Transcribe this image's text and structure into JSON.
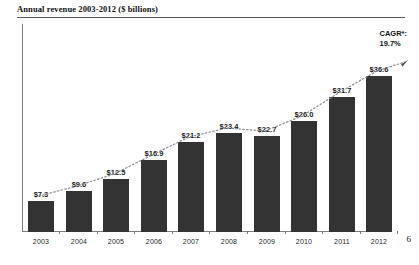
{
  "slide": {
    "title": "Annual revenue 2003-2012 ($ billions)",
    "page_number": "6"
  },
  "annotation": {
    "cagr_label": "CAGR*:",
    "cagr_value": "19.7%"
  },
  "chart_data": {
    "type": "bar",
    "title": "Annual revenue 2003-2012 ($ billions)",
    "xlabel": "",
    "ylabel": "",
    "ylim": [
      0,
      40
    ],
    "grid": false,
    "legend": null,
    "categories": [
      "2003",
      "2004",
      "2005",
      "2006",
      "2007",
      "2008",
      "2009",
      "2010",
      "2011",
      "2012"
    ],
    "values": [
      7.3,
      9.6,
      12.5,
      16.9,
      21.2,
      23.4,
      22.7,
      26.0,
      31.7,
      36.6
    ],
    "value_labels": [
      "$7.3",
      "$9.6",
      "$12.5",
      "$16.9",
      "$21.2",
      "$23.4",
      "$22.7",
      "$26.0",
      "$31.7",
      "$36.6"
    ],
    "bar_color": "#333333",
    "annotations": [
      {
        "text": "CAGR*:",
        "position": "top-right"
      },
      {
        "text": "19.7%",
        "position": "top-right"
      }
    ],
    "trendline": {
      "style": "dotted",
      "arrow": true,
      "color": "#8a8f93"
    }
  }
}
